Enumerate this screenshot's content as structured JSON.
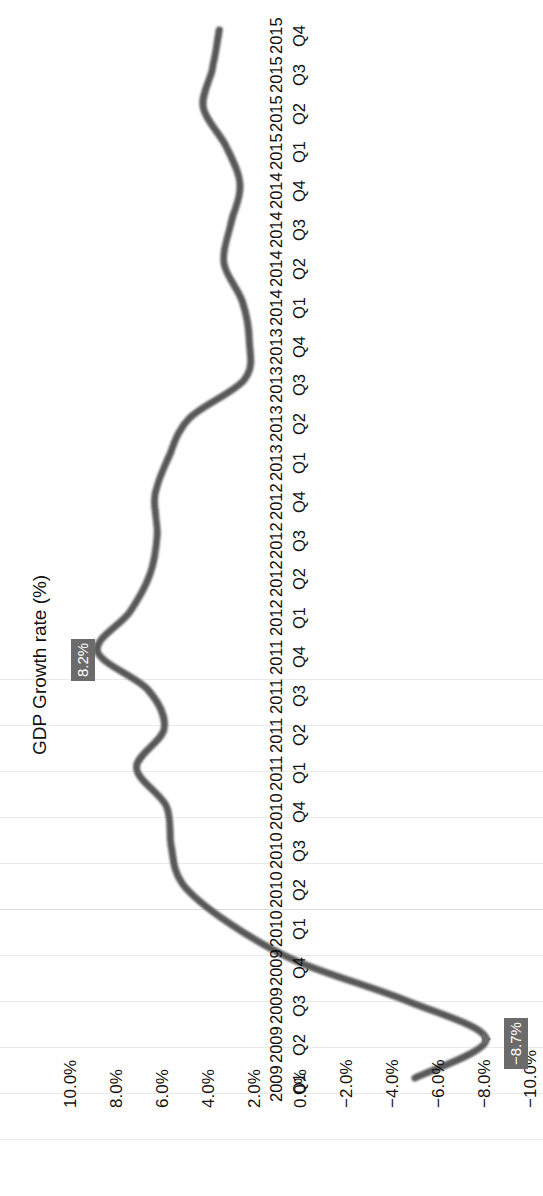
{
  "chart_data": {
    "type": "line",
    "title": "",
    "xlabel": "",
    "ylabel": "GDP Growth rate (%)",
    "orientation": "rotated-90-ccw",
    "grid": "vertical-gridlines-at-y-ticks",
    "legend": "none",
    "ylim": [
      -10.0,
      10.0
    ],
    "ytick_labels": [
      "10.0%",
      "8.0%",
      "6.0%",
      "4.0%",
      "2.0%",
      "0.0%",
      "-2.0%",
      "-4.0%",
      "-6.0%",
      "-8.0%",
      "-10.0%"
    ],
    "ytick_values": [
      10.0,
      8.0,
      6.0,
      4.0,
      2.0,
      0.0,
      -2.0,
      -4.0,
      -6.0,
      -8.0,
      -10.0
    ],
    "categories": [
      "2009 Q1",
      "2009 Q2",
      "2009 Q3",
      "2009 Q4",
      "2010 Q1",
      "2010 Q2",
      "2010 Q3",
      "2010 Q4",
      "2011 Q1",
      "2011 Q2",
      "2011 Q3",
      "2011 Q4",
      "2012 Q1",
      "2012 Q2",
      "2012 Q3",
      "2012 Q4",
      "2013 Q1",
      "2013 Q2",
      "2013 Q3",
      "2013 Q4",
      "2014 Q1",
      "2014 Q2",
      "2014 Q3",
      "2014 Q4",
      "2015 Q1",
      "2015 Q2",
      "2015 Q3",
      "2015 Q4"
    ],
    "category_years": [
      "2009",
      "2009",
      "2009",
      "2009",
      "2010",
      "2010",
      "2010",
      "2010",
      "2011",
      "2011",
      "2011",
      "2011",
      "2012",
      "2012",
      "2012",
      "2012",
      "2013",
      "2013",
      "2013",
      "2013",
      "2014",
      "2014",
      "2014",
      "2014",
      "2015",
      "2015",
      "2015",
      "2015"
    ],
    "category_quarters": [
      "Q1",
      "Q2",
      "Q3",
      "Q4",
      "Q1",
      "Q2",
      "Q3",
      "Q4",
      "Q1",
      "Q2",
      "Q3",
      "Q4",
      "Q1",
      "Q2",
      "Q3",
      "Q4",
      "Q1",
      "Q2",
      "Q3",
      "Q4",
      "Q1",
      "Q2",
      "Q3",
      "Q4",
      "Q1",
      "Q2",
      "Q3",
      "Q4"
    ],
    "values": [
      -5.6,
      -8.7,
      -5.2,
      -0.5,
      2.5,
      4.5,
      5.0,
      5.2,
      6.5,
      5.3,
      6.0,
      8.2,
      6.8,
      5.9,
      5.6,
      5.7,
      5.1,
      4.2,
      1.8,
      1.6,
      1.9,
      2.7,
      2.4,
      2.0,
      2.6,
      3.6,
      3.2,
      2.9
    ],
    "annotations": [
      {
        "label": "8.2%",
        "category": "2011 Q4",
        "value": 8.2,
        "style": "dark-box-white-text"
      },
      {
        "label": "-8.7%",
        "category": "2009 Q2",
        "value": -8.7,
        "style": "dark-box-white-text",
        "marker": "triangle"
      }
    ],
    "series_color": "#585858",
    "annotation_bg": "#6b6b6b",
    "annotation_fg": "#ffffff",
    "gridline_color": "#e9e9e9"
  },
  "axis": {
    "title_text": "GDP Growth rate (%)"
  }
}
